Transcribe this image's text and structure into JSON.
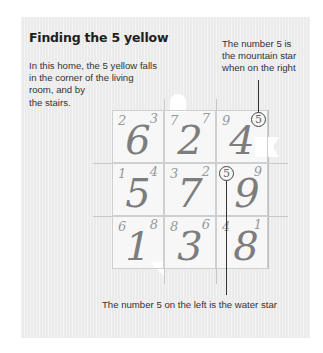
{
  "title": "Finding the 5 yellow",
  "intro": {
    "lines": [
      "In this home, the 5 yellow falls",
      "in the corner of the living",
      "room, and by",
      "the stairs."
    ]
  },
  "annotations": {
    "mountain_star": {
      "lines": [
        "The number 5 is",
        "the mountain star",
        "when on the right"
      ]
    },
    "water_star": "The number 5 on the left is the water star"
  },
  "grid": {
    "cells": [
      {
        "main": "6",
        "left": "2",
        "right": "3"
      },
      {
        "main": "2",
        "left": "7",
        "right": "7"
      },
      {
        "main": "4",
        "left": "9",
        "right": "5"
      },
      {
        "main": "5",
        "left": "1",
        "right": "4"
      },
      {
        "main": "7",
        "left": "3",
        "right": "2"
      },
      {
        "main": "9",
        "left": "5",
        "right": "9"
      },
      {
        "main": "1",
        "left": "6",
        "right": "8"
      },
      {
        "main": "3",
        "left": "8",
        "right": "6"
      },
      {
        "main": "8",
        "left": "4",
        "right": "1"
      }
    ],
    "circled": [
      "5",
      "5"
    ]
  },
  "colors": {
    "panel_bg": "#ebebeb",
    "digit": "#7d7d7d",
    "text": "#333333"
  }
}
